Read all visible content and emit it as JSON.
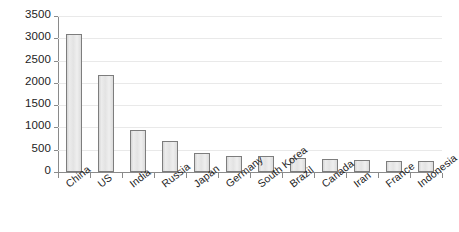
{
  "chart_data": {
    "type": "bar",
    "title": "",
    "xlabel": "",
    "ylabel": "",
    "ylim": [
      0,
      3500
    ],
    "ytick_step": 500,
    "yticks": [
      "0",
      "500",
      "1000",
      "1500",
      "2000",
      "2500",
      "3000",
      "3500"
    ],
    "grid": true,
    "legend": "none",
    "categories": [
      "China",
      "US",
      "India",
      "Russia",
      "Japan",
      "Germany",
      "South Korea",
      "Brazil",
      "Canada",
      "Iran",
      "France",
      "Indonesia"
    ],
    "values": [
      3100,
      2180,
      940,
      700,
      430,
      350,
      350,
      320,
      300,
      280,
      250,
      250
    ],
    "bar_fill_color": "#e2e2e2",
    "bar_border_color": "#7d7d7d",
    "gridline_color": "#e9e9e9",
    "axis_color": "#8a8a8a",
    "text_color": "#1d1d1d"
  }
}
